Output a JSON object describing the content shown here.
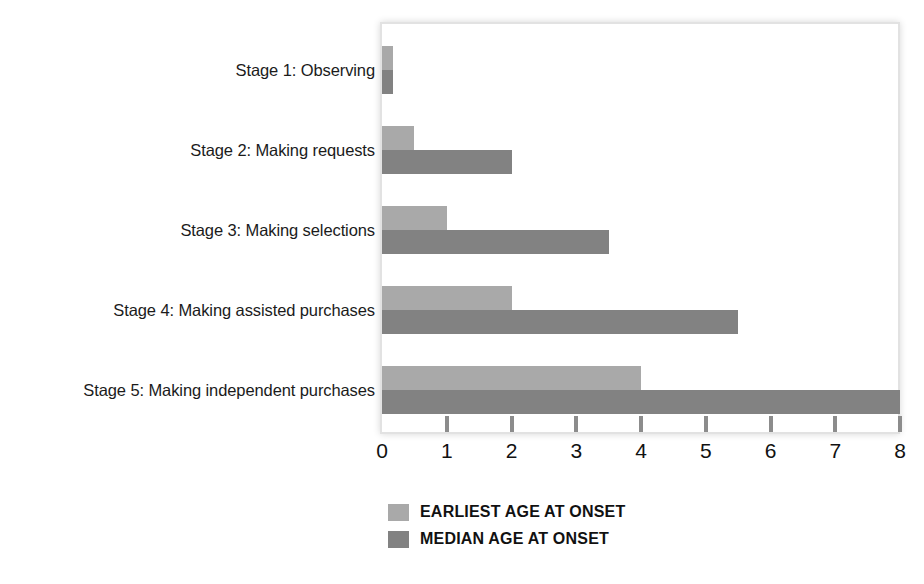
{
  "chart_data": {
    "type": "bar",
    "orientation": "horizontal",
    "title": "",
    "xlabel": "",
    "ylabel": "",
    "xlim": [
      0,
      8
    ],
    "xticks": [
      0,
      1,
      2,
      3,
      4,
      5,
      6,
      7,
      8
    ],
    "xtick_labels": [
      "0",
      "1",
      "2",
      "3",
      "4",
      "5",
      "6",
      "7",
      "8"
    ],
    "grid": false,
    "legend_position": "bottom-left",
    "categories": [
      "Stage 1: Observing",
      "Stage 2: Making requests",
      "Stage 3: Making selections",
      "Stage 4: Making assisted purchases",
      "Stage 5: Making independent purchases"
    ],
    "series": [
      {
        "name": "EARLIEST AGE AT ONSET",
        "color": "#a9a9a9",
        "values": [
          0.17,
          0.5,
          1.0,
          2.0,
          4.0
        ]
      },
      {
        "name": "MEDIAN AGE AT ONSET",
        "color": "#828282",
        "values": [
          0.17,
          2.0,
          3.5,
          5.5,
          8.0
        ]
      }
    ]
  },
  "legend": {
    "items": [
      {
        "label": "EARLIEST AGE AT ONSET",
        "color": "#a9a9a9",
        "swatch_name": "legend-swatch-earliest"
      },
      {
        "label": "MEDIAN AGE AT ONSET",
        "color": "#828282",
        "swatch_name": "legend-swatch-median"
      }
    ]
  },
  "colors": {
    "earliest": "#a9a9a9",
    "median": "#828282",
    "plot_border": "#e2e2e2",
    "tick": "#8c8c8c",
    "text": "#111111",
    "background": "#ffffff"
  }
}
